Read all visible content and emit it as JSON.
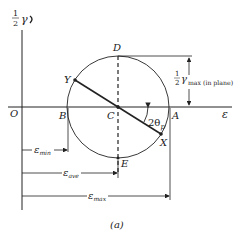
{
  "diagram": {
    "title_label": "(a)",
    "axes": {
      "vertical_label_fraction_num": "1",
      "vertical_label_fraction_den": "2",
      "vertical_label_symbol": "γ",
      "horizontal_label": "ε",
      "origin_label": "O"
    },
    "points": {
      "A": "A",
      "B": "B",
      "C": "C",
      "D": "D",
      "E": "E",
      "X": "X",
      "Y": "Y"
    },
    "angle_label": "2θ",
    "angle_subscript": "p",
    "radius_label_num": "1",
    "radius_label_den": "2",
    "radius_label_symbol": "γ",
    "radius_label_subscript": "max (in plane)",
    "dimensions": {
      "min": {
        "symbol": "ε",
        "subscript": "min"
      },
      "ave": {
        "symbol": "ε",
        "subscript": "ave"
      },
      "max": {
        "symbol": "ε",
        "subscript": "max"
      }
    },
    "colors": {
      "line": "#222222",
      "background": "#ffffff"
    }
  }
}
